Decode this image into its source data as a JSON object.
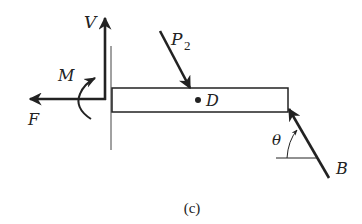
{
  "diagram": {
    "type": "free-body-diagram",
    "caption": "(c)",
    "labels": {
      "V": "V",
      "M": "M",
      "F": "F",
      "P": "P",
      "P_sub": "2",
      "D": "D",
      "theta": "θ",
      "B": "B"
    },
    "elements": [
      {
        "id": "beam",
        "kind": "rectangle",
        "desc": "horizontal beam segment"
      },
      {
        "id": "cut-line",
        "kind": "line",
        "desc": "vertical section line at left end"
      },
      {
        "id": "V",
        "kind": "force-arrow",
        "direction": "up"
      },
      {
        "id": "F",
        "kind": "force-arrow",
        "direction": "left"
      },
      {
        "id": "M",
        "kind": "moment-arrow",
        "direction": "counterclockwise"
      },
      {
        "id": "P2",
        "kind": "force-arrow",
        "direction": "down-right, onto beam top"
      },
      {
        "id": "D",
        "kind": "point",
        "desc": "point D at beam center"
      },
      {
        "id": "B",
        "kind": "force-arrow",
        "direction": "up-left at angle theta to horizontal, onto beam right end"
      }
    ],
    "colors": {
      "ink": "#222222",
      "background": "#ffffff"
    }
  }
}
